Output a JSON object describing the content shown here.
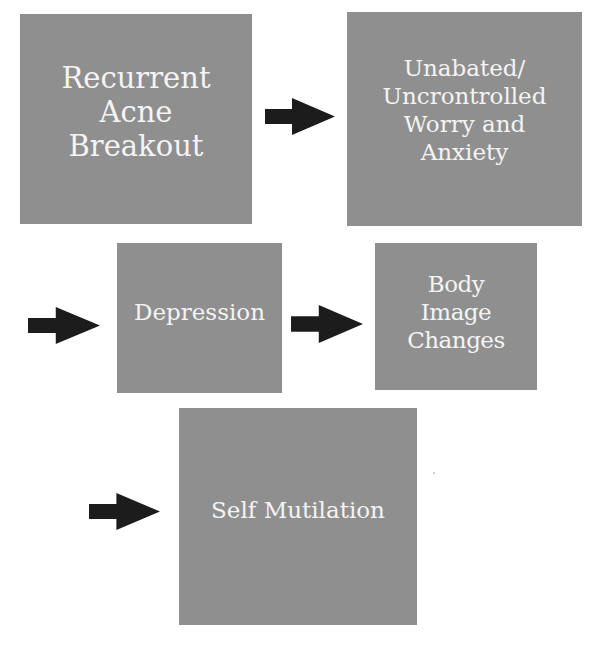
{
  "diagram": {
    "type": "flowchart",
    "colors": {
      "box_fill": "#8f8f8f",
      "box_text": "#f4f4f4",
      "arrow": "#1c1c1c",
      "background": "#ffffff"
    },
    "nodes": [
      {
        "id": "recurrent-acne-breakout",
        "label": "Recurrent\nAcne\nBreakout"
      },
      {
        "id": "worry-and-anxiety",
        "label": "Unabated/\nUncrontrolled\nWorry and\nAnxiety"
      },
      {
        "id": "depression",
        "label": "Depression"
      },
      {
        "id": "body-image-changes",
        "label": "Body\nImage\nChanges"
      },
      {
        "id": "self-mutilation",
        "label": "Self Mutilation"
      }
    ],
    "edges": [
      {
        "from": "recurrent-acne-breakout",
        "to": "worry-and-anxiety",
        "icon": "right-arrow-icon"
      },
      {
        "from": "worry-and-anxiety",
        "to": "depression",
        "icon": "right-arrow-icon"
      },
      {
        "from": "depression",
        "to": "body-image-changes",
        "icon": "right-arrow-icon"
      },
      {
        "from": "body-image-changes",
        "to": "self-mutilation",
        "icon": "right-arrow-icon"
      }
    ]
  }
}
